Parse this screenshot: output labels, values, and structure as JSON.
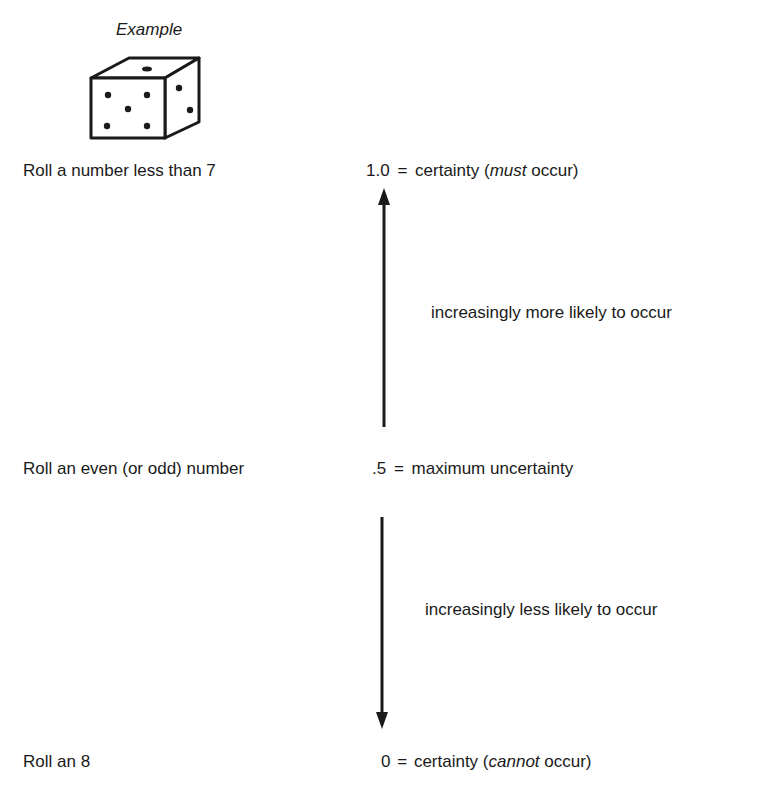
{
  "example": {
    "label": "Example",
    "die": {
      "front_pips": 5,
      "top_pips": 1,
      "right_pips": 2
    }
  },
  "scale": {
    "top": {
      "event": "Roll a number less than 7",
      "value": "1.0",
      "eq": "=",
      "desc_pre": "certainty (",
      "desc_em": "must",
      "desc_post": " occur)"
    },
    "middle": {
      "event": "Roll an even (or odd) number",
      "value": ".5",
      "eq": "=",
      "desc": "maximum uncertainty"
    },
    "bottom": {
      "event": "Roll an 8",
      "value": "0",
      "eq": "=",
      "desc_pre": "certainty (",
      "desc_em": "cannot",
      "desc_post": " occur)"
    }
  },
  "arrows": {
    "up_label": "increasingly more likely to occur",
    "down_label": "increasingly less likely to occur"
  },
  "colors": {
    "ink": "#1a1a1a",
    "background": "#ffffff"
  }
}
